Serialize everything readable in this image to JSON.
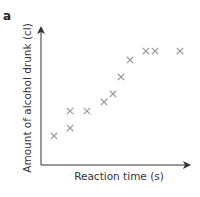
{
  "panel_label": "a",
  "colors": {
    "axis": "#333333",
    "marker": "#9a9a9a",
    "text": "#333333"
  },
  "chart_data": {
    "type": "scatter",
    "title": "",
    "panel": "a",
    "xlabel": "Reaction time (s)",
    "ylabel": "Amount of alcohol drunk (cl)",
    "xlim": [
      0,
      100
    ],
    "ylim": [
      0,
      100
    ],
    "units_note": "no tick labels shown; values in relative axis units",
    "grid": false,
    "legend": "none",
    "marker": "x",
    "points": [
      {
        "x": 8.9,
        "y": 21.5
      },
      {
        "x": 19.9,
        "y": 27.4
      },
      {
        "x": 19.9,
        "y": 40.0
      },
      {
        "x": 31.5,
        "y": 40.0
      },
      {
        "x": 43.2,
        "y": 46.7
      },
      {
        "x": 49.3,
        "y": 52.6
      },
      {
        "x": 54.8,
        "y": 65.2
      },
      {
        "x": 61.0,
        "y": 77.8
      },
      {
        "x": 71.9,
        "y": 84.4
      },
      {
        "x": 78.1,
        "y": 84.4
      },
      {
        "x": 95.2,
        "y": 84.4
      }
    ]
  }
}
